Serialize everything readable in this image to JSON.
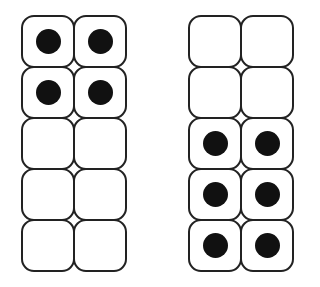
{
  "diagram": {
    "type": "ten-frames",
    "frames": [
      {
        "name": "left-ten-frame",
        "count": 4,
        "rows": [
          [
            true,
            true
          ],
          [
            true,
            true
          ],
          [
            false,
            false
          ],
          [
            false,
            false
          ],
          [
            false,
            false
          ]
        ]
      },
      {
        "name": "right-ten-frame",
        "count": 6,
        "rows": [
          [
            false,
            false
          ],
          [
            false,
            false
          ],
          [
            true,
            true
          ],
          [
            true,
            true
          ],
          [
            true,
            true
          ]
        ]
      }
    ],
    "colors": {
      "stroke": "#222222",
      "dot": "#111111",
      "background": "#ffffff"
    }
  }
}
